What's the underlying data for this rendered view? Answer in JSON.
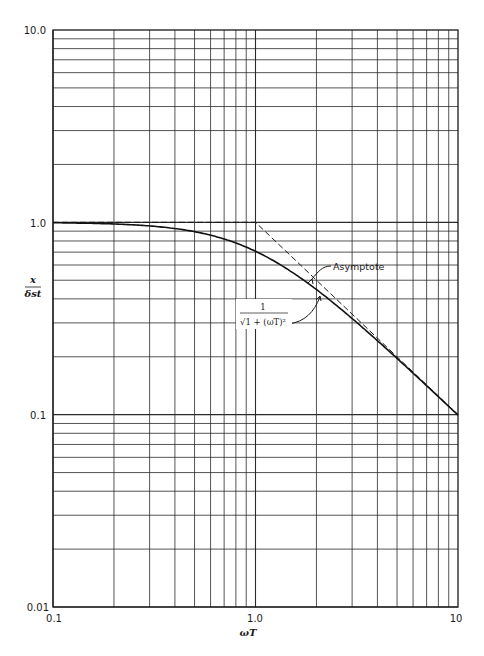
{
  "chart_data": {
    "type": "line",
    "title": "",
    "xlabel": "ωT",
    "ylabel": "x / δst",
    "ylabel_num": "x",
    "ylabel_den": "δst",
    "xscale": "log",
    "yscale": "log",
    "xlim": [
      0.1,
      10
    ],
    "ylim": [
      0.01,
      10
    ],
    "grid": true,
    "x_tick_labels": [
      "0.1",
      "1.0",
      "10"
    ],
    "y_tick_labels": [
      "10.0",
      "1.0",
      "0.1",
      "0.01"
    ],
    "series": [
      {
        "name": "1/√(1+(ωT)²)",
        "style": "solid",
        "x": [
          0.1,
          0.2,
          0.3,
          0.5,
          0.7,
          1.0,
          1.5,
          2.0,
          3.0,
          5.0,
          7.0,
          10.0
        ],
        "values": [
          0.995,
          0.981,
          0.958,
          0.894,
          0.819,
          0.707,
          0.555,
          0.447,
          0.316,
          0.196,
          0.141,
          0.0995
        ]
      },
      {
        "name": "Asymptote",
        "style": "dashed",
        "x": [
          0.1,
          1.0,
          10.0
        ],
        "values": [
          1.0,
          1.0,
          0.1
        ]
      }
    ],
    "annotations": [
      {
        "text": "Asymptote",
        "target": "dashed asymptote line near ωT≈2"
      },
      {
        "text": "1/√(1+(ωT)²)",
        "numerator": "1",
        "denominator": "√1 + (ωT)²",
        "target": "solid curve near ωT≈2.5"
      }
    ]
  }
}
